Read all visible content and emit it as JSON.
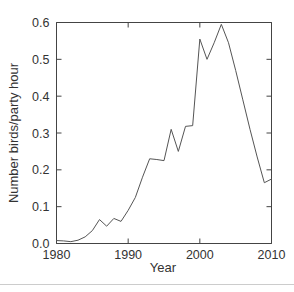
{
  "figure": {
    "background_color": "#ffffff",
    "line_color": "#555555",
    "axis_color": "#444444",
    "text_color": "#333333",
    "footer_rule_color": "#cccccc"
  },
  "chart_data": {
    "type": "line",
    "title": "",
    "subtitle": "",
    "xlabel": "Year",
    "ylabel": "Number birds/party hour",
    "xlim": [
      1980,
      2010
    ],
    "ylim": [
      0.0,
      0.6
    ],
    "grid": false,
    "legend": null,
    "legend_position": "none",
    "xticks": [
      1980,
      1990,
      2000,
      2010
    ],
    "xtick_labels": [
      "1980",
      "1990",
      "2000",
      "2010"
    ],
    "yticks": [
      0.0,
      0.1,
      0.2,
      0.3,
      0.4,
      0.5,
      0.6
    ],
    "ytick_labels": [
      "0.0",
      "0.1",
      "0.2",
      "0.3",
      "0.4",
      "0.5",
      "0.6"
    ],
    "x": [
      1980,
      1981,
      1982,
      1983,
      1984,
      1985,
      1986,
      1987,
      1988,
      1989,
      1990,
      1991,
      1992,
      1993,
      1994,
      1995,
      1996,
      1997,
      1998,
      1999,
      2000,
      2001,
      2002,
      2003,
      2004,
      2005,
      2006,
      2007,
      2008,
      2009,
      2010
    ],
    "values": [
      0.008,
      0.007,
      0.005,
      0.009,
      0.018,
      0.035,
      0.065,
      0.047,
      0.068,
      0.06,
      0.09,
      0.125,
      0.18,
      0.23,
      0.228,
      0.225,
      0.31,
      0.25,
      0.318,
      0.32,
      0.555,
      0.5,
      0.545,
      0.595,
      0.545,
      0.47,
      0.39,
      0.31,
      0.235,
      0.165,
      0.175
    ],
    "series": [
      {
        "name": "Number birds/party hour",
        "values": [
          0.008,
          0.007,
          0.005,
          0.009,
          0.018,
          0.035,
          0.065,
          0.047,
          0.068,
          0.06,
          0.09,
          0.125,
          0.18,
          0.23,
          0.228,
          0.225,
          0.31,
          0.25,
          0.318,
          0.32,
          0.555,
          0.5,
          0.545,
          0.595,
          0.545,
          0.47,
          0.39,
          0.31,
          0.235,
          0.165,
          0.175
        ]
      }
    ]
  }
}
